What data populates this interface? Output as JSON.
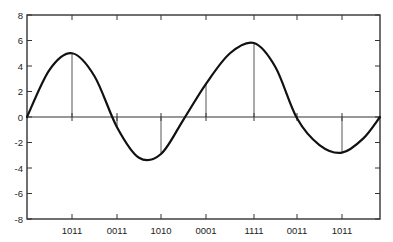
{
  "chart_data": {
    "type": "line",
    "title": "",
    "xlabel": "",
    "ylabel": "",
    "ylim": [
      -8,
      8
    ],
    "yticks": [
      -8,
      -6,
      -4,
      -2,
      0,
      2,
      4,
      6,
      8
    ],
    "grid": false,
    "legend": null,
    "x_categories": [
      "1011",
      "0011",
      "1010",
      "0001",
      "1111",
      "0011",
      "1011"
    ],
    "sample_values": [
      5.0,
      -0.8,
      -2.9,
      2.6,
      5.8,
      -0.1,
      -2.8
    ],
    "curve": {
      "description": "Smooth continuous waveform (signal) passing through sampled points, starting and ending at 0",
      "x": [
        0,
        0.5,
        1,
        1.5,
        2,
        2.5,
        3,
        3.5,
        4,
        4.5,
        5,
        5.5,
        6,
        6.5,
        7,
        7.5,
        7.9
      ],
      "y": [
        0,
        3.7,
        5.0,
        3.2,
        -0.8,
        -3.2,
        -2.9,
        -0.2,
        2.6,
        5.0,
        5.8,
        3.9,
        -0.1,
        -2.2,
        -2.8,
        -1.7,
        0
      ]
    },
    "series": [
      {
        "name": "analog signal",
        "style": "curve"
      },
      {
        "name": "samples",
        "style": "stem",
        "values": [
          5.0,
          -0.8,
          -2.9,
          2.6,
          5.8,
          -0.1,
          -2.8
        ]
      }
    ]
  },
  "layout": {
    "plot_left": 27,
    "plot_right": 380,
    "plot_top": 15,
    "plot_bottom": 219,
    "tick_x": [
      72,
      117,
      161,
      206,
      254,
      297,
      342
    ],
    "x_end": 380
  }
}
